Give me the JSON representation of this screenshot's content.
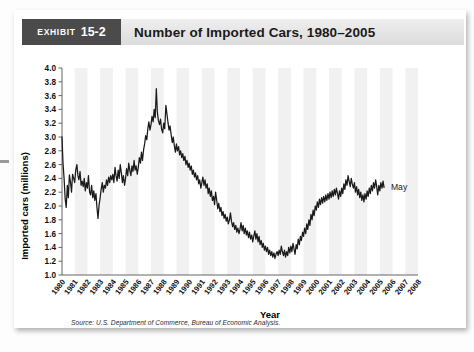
{
  "exhibit": {
    "word": "Exhibit",
    "number": "15-2",
    "title": "Number of Imported Cars, 1980–2005"
  },
  "source": {
    "prefix": "Source:",
    "text": "U.S. Department of Commerce, Bureau of Economic Analysis."
  },
  "annotations": [
    {
      "label": "May",
      "x_year": 2005.4,
      "y_value": 2.27
    }
  ],
  "chart_data": {
    "type": "line",
    "title": "Number of Imported Cars, 1980–2005",
    "xlabel": "Year",
    "ylabel": "Imported cars (millions)",
    "xlim": [
      1980,
      2008
    ],
    "ylim": [
      1.0,
      4.0
    ],
    "ytick_step": 0.2,
    "grid": false,
    "band_shading": "alternating vertical light bands per year",
    "legend": "none",
    "ytick_labels": [
      "1.0",
      "1.2",
      "1.4",
      "1.6",
      "1.8",
      "2.0",
      "2.2",
      "2.4",
      "2.6",
      "2.8",
      "3.0",
      "3.2",
      "3.4",
      "3.6",
      "3.8",
      "4.0"
    ],
    "xtick_labels": [
      "1980",
      "1981",
      "1982",
      "1983",
      "1984",
      "1985",
      "1986",
      "1987",
      "1988",
      "1989",
      "1990",
      "1991",
      "1992",
      "1993",
      "1994",
      "1995",
      "1996",
      "1997",
      "1998",
      "1999",
      "2000",
      "2001",
      "2002",
      "2003",
      "2004",
      "2005",
      "2006",
      "2007",
      "2008"
    ],
    "series": [
      {
        "name": "Imported cars (millions)",
        "color": "#1a1a1a",
        "x": [
          1980.0,
          1980.08,
          1980.17,
          1980.25,
          1980.33,
          1980.42,
          1980.5,
          1980.58,
          1980.67,
          1980.75,
          1980.83,
          1980.92,
          1981.0,
          1981.08,
          1981.17,
          1981.25,
          1981.33,
          1981.42,
          1981.5,
          1981.58,
          1981.67,
          1981.75,
          1981.83,
          1981.92,
          1982.0,
          1982.08,
          1982.17,
          1982.25,
          1982.33,
          1982.42,
          1982.5,
          1982.58,
          1982.67,
          1982.75,
          1982.83,
          1982.92,
          1983.0,
          1983.08,
          1983.17,
          1983.25,
          1983.33,
          1983.42,
          1983.5,
          1983.58,
          1983.67,
          1983.75,
          1983.83,
          1983.92,
          1984.0,
          1984.08,
          1984.17,
          1984.25,
          1984.33,
          1984.42,
          1984.5,
          1984.58,
          1984.67,
          1984.75,
          1984.83,
          1984.92,
          1985.0,
          1985.08,
          1985.17,
          1985.25,
          1985.33,
          1985.42,
          1985.5,
          1985.58,
          1985.67,
          1985.75,
          1985.83,
          1985.92,
          1986.0,
          1986.08,
          1986.17,
          1986.25,
          1986.33,
          1986.42,
          1986.5,
          1986.58,
          1986.67,
          1986.75,
          1986.83,
          1986.92,
          1987.0,
          1987.08,
          1987.17,
          1987.25,
          1987.33,
          1987.42,
          1987.5,
          1987.58,
          1987.67,
          1987.75,
          1987.83,
          1987.92,
          1988.0,
          1988.08,
          1988.17,
          1988.25,
          1988.33,
          1988.42,
          1988.5,
          1988.58,
          1988.67,
          1988.75,
          1988.83,
          1988.92,
          1989.0,
          1989.08,
          1989.17,
          1989.25,
          1989.33,
          1989.42,
          1989.5,
          1989.58,
          1989.67,
          1989.75,
          1989.83,
          1989.92,
          1990.0,
          1990.08,
          1990.17,
          1990.25,
          1990.33,
          1990.42,
          1990.5,
          1990.58,
          1990.67,
          1990.75,
          1990.83,
          1990.92,
          1991.0,
          1991.08,
          1991.17,
          1991.25,
          1991.33,
          1991.42,
          1991.5,
          1991.58,
          1991.67,
          1991.75,
          1991.83,
          1991.92,
          1992.0,
          1992.08,
          1992.17,
          1992.25,
          1992.33,
          1992.42,
          1992.5,
          1992.58,
          1992.67,
          1992.75,
          1992.83,
          1992.92,
          1993.0,
          1993.08,
          1993.17,
          1993.25,
          1993.33,
          1993.42,
          1993.5,
          1993.58,
          1993.67,
          1993.75,
          1993.83,
          1993.92,
          1994.0,
          1994.08,
          1994.17,
          1994.25,
          1994.33,
          1994.42,
          1994.5,
          1994.58,
          1994.67,
          1994.75,
          1994.83,
          1994.92,
          1995.0,
          1995.08,
          1995.17,
          1995.25,
          1995.33,
          1995.42,
          1995.5,
          1995.58,
          1995.67,
          1995.75,
          1995.83,
          1995.92,
          1996.0,
          1996.08,
          1996.17,
          1996.25,
          1996.33,
          1996.42,
          1996.5,
          1996.58,
          1996.67,
          1996.75,
          1996.83,
          1996.92,
          1997.0,
          1997.08,
          1997.17,
          1997.25,
          1997.33,
          1997.42,
          1997.5,
          1997.58,
          1997.67,
          1997.75,
          1997.83,
          1997.92,
          1998.0,
          1998.08,
          1998.17,
          1998.25,
          1998.33,
          1998.42,
          1998.5,
          1998.58,
          1998.67,
          1998.75,
          1998.83,
          1998.92,
          1999.0,
          1999.08,
          1999.17,
          1999.25,
          1999.33,
          1999.42,
          1999.5,
          1999.58,
          1999.67,
          1999.75,
          1999.83,
          1999.92,
          2000.0,
          2000.08,
          2000.17,
          2000.25,
          2000.33,
          2000.42,
          2000.5,
          2000.58,
          2000.67,
          2000.75,
          2000.83,
          2000.92,
          2001.0,
          2001.08,
          2001.17,
          2001.25,
          2001.33,
          2001.42,
          2001.5,
          2001.58,
          2001.67,
          2001.75,
          2001.83,
          2001.92,
          2002.0,
          2002.08,
          2002.17,
          2002.25,
          2002.33,
          2002.42,
          2002.5,
          2002.58,
          2002.67,
          2002.75,
          2002.83,
          2002.92,
          2003.0,
          2003.08,
          2003.17,
          2003.25,
          2003.33,
          2003.42,
          2003.5,
          2003.58,
          2003.67,
          2003.75,
          2003.83,
          2003.92,
          2004.0,
          2004.08,
          2004.17,
          2004.25,
          2004.33,
          2004.42,
          2004.5,
          2004.58,
          2004.67,
          2004.75,
          2004.83,
          2004.92,
          2005.0,
          2005.08,
          2005.17,
          2005.25,
          2005.33
        ],
        "y": [
          3.0,
          2.62,
          2.38,
          2.1,
          1.98,
          2.3,
          2.12,
          2.45,
          2.34,
          2.2,
          2.46,
          2.4,
          2.34,
          2.52,
          2.6,
          2.44,
          2.38,
          2.5,
          2.3,
          2.36,
          2.28,
          2.4,
          2.22,
          2.34,
          2.26,
          2.44,
          2.2,
          2.16,
          2.3,
          2.12,
          2.22,
          2.08,
          2.18,
          1.98,
          1.82,
          2.02,
          2.12,
          2.24,
          2.34,
          2.2,
          2.3,
          2.26,
          2.38,
          2.3,
          2.42,
          2.34,
          2.44,
          2.38,
          2.46,
          2.34,
          2.56,
          2.44,
          2.36,
          2.52,
          2.4,
          2.6,
          2.48,
          2.34,
          2.44,
          2.3,
          2.4,
          2.54,
          2.44,
          2.62,
          2.52,
          2.44,
          2.58,
          2.5,
          2.66,
          2.52,
          2.58,
          2.46,
          2.56,
          2.7,
          2.62,
          2.78,
          2.66,
          2.82,
          2.9,
          3.02,
          2.96,
          3.12,
          3.22,
          3.1,
          3.18,
          3.3,
          3.22,
          3.4,
          3.28,
          3.7,
          3.36,
          3.24,
          3.18,
          3.26,
          3.12,
          3.06,
          3.2,
          3.12,
          3.46,
          3.34,
          3.22,
          3.1,
          3.16,
          3.04,
          2.92,
          3.0,
          2.88,
          2.78,
          2.9,
          2.8,
          2.86,
          2.74,
          2.8,
          2.7,
          2.76,
          2.66,
          2.72,
          2.6,
          2.66,
          2.56,
          2.62,
          2.52,
          2.58,
          2.46,
          2.52,
          2.42,
          2.48,
          2.38,
          2.44,
          2.32,
          2.38,
          2.26,
          2.34,
          2.42,
          2.3,
          2.38,
          2.26,
          2.32,
          2.18,
          2.26,
          2.14,
          2.22,
          2.08,
          2.14,
          2.02,
          2.2,
          2.08,
          1.96,
          2.04,
          1.92,
          1.98,
          1.86,
          1.92,
          1.82,
          1.88,
          1.78,
          1.84,
          1.74,
          1.8,
          1.9,
          1.78,
          1.7,
          1.76,
          1.66,
          1.72,
          1.62,
          1.68,
          1.6,
          1.66,
          1.76,
          1.64,
          1.72,
          1.6,
          1.68,
          1.58,
          1.64,
          1.54,
          1.62,
          1.52,
          1.58,
          1.48,
          1.56,
          1.64,
          1.52,
          1.6,
          1.48,
          1.56,
          1.44,
          1.5,
          1.4,
          1.46,
          1.36,
          1.42,
          1.34,
          1.4,
          1.3,
          1.36,
          1.28,
          1.34,
          1.26,
          1.32,
          1.24,
          1.3,
          1.34,
          1.28,
          1.36,
          1.3,
          1.42,
          1.34,
          1.28,
          1.36,
          1.26,
          1.34,
          1.28,
          1.4,
          1.32,
          1.42,
          1.34,
          1.46,
          1.38,
          1.3,
          1.44,
          1.38,
          1.52,
          1.44,
          1.56,
          1.5,
          1.62,
          1.56,
          1.68,
          1.6,
          1.74,
          1.66,
          1.8,
          1.72,
          1.88,
          1.8,
          1.94,
          1.86,
          2.0,
          1.94,
          2.06,
          1.98,
          2.1,
          2.02,
          2.12,
          2.04,
          2.14,
          2.06,
          2.16,
          2.08,
          2.18,
          2.1,
          2.2,
          2.12,
          2.22,
          2.14,
          2.24,
          2.16,
          2.26,
          2.18,
          2.1,
          2.22,
          2.14,
          2.26,
          2.18,
          2.32,
          2.24,
          2.38,
          2.3,
          2.44,
          2.36,
          2.28,
          2.4,
          2.32,
          2.26,
          2.34,
          2.2,
          2.28,
          2.16,
          2.24,
          2.12,
          2.2,
          2.08,
          2.16,
          2.06,
          2.18,
          2.1,
          2.22,
          2.14,
          2.26,
          2.18,
          2.3,
          2.22,
          2.34,
          2.26,
          2.38,
          2.28,
          2.16,
          2.3,
          2.22,
          2.34,
          2.26,
          2.36,
          2.27
        ]
      }
    ]
  }
}
